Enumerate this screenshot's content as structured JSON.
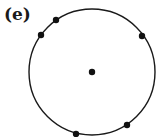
{
  "figure": {
    "label": "(e)",
    "circle": {
      "cx": 92,
      "cy": 72,
      "r": 63,
      "stroke": "#1a1a1a"
    },
    "points": [
      {
        "name": "center-point",
        "x": 92,
        "y": 72
      },
      {
        "name": "point-upper-left-1",
        "x": 56,
        "y": 20
      },
      {
        "name": "point-upper-left-2",
        "x": 41,
        "y": 35
      },
      {
        "name": "point-upper-right",
        "x": 142,
        "y": 36
      },
      {
        "name": "point-lower-right",
        "x": 127,
        "y": 125
      },
      {
        "name": "point-bottom",
        "x": 76,
        "y": 134
      }
    ],
    "point_color": "#111111"
  }
}
